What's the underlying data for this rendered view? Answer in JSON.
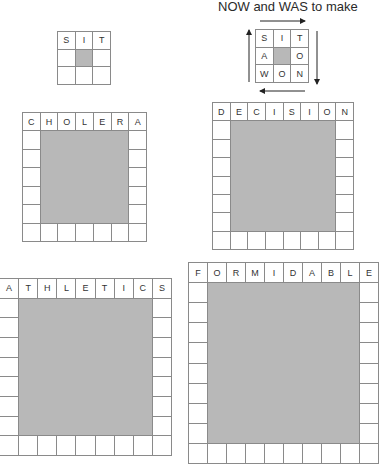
{
  "caption": "NOW and WAS to make",
  "colors": {
    "line": "#8a8a8a",
    "shade": "#b8b8b8",
    "text": "#333333"
  },
  "grids": [
    {
      "id": "sit-example",
      "word": "SIT",
      "size": 3,
      "box": {
        "left": 57,
        "top": 31,
        "width": 54,
        "height": 54
      },
      "top_row": [
        "S",
        "I",
        "T"
      ],
      "left_col": [
        "",
        "",
        ""
      ],
      "right_col": [
        "",
        "",
        ""
      ],
      "bottom_row": [
        "",
        "",
        ""
      ]
    },
    {
      "id": "sit-solved",
      "word": "SIT",
      "size": 3,
      "box": {
        "left": 255,
        "top": 29,
        "width": 54,
        "height": 54
      },
      "top_row": [
        "S",
        "I",
        "T"
      ],
      "left_col": [
        "S",
        "A",
        "W"
      ],
      "right_col": [
        "T",
        "O",
        "N"
      ],
      "bottom_row": [
        "W",
        "O",
        "N"
      ]
    },
    {
      "id": "cholera",
      "word": "CHOLERA",
      "size": 7,
      "box": {
        "left": 22,
        "top": 112,
        "width": 125,
        "height": 130
      },
      "top_row": [
        "C",
        "H",
        "O",
        "L",
        "E",
        "R",
        "A"
      ]
    },
    {
      "id": "decision",
      "word": "DECISION",
      "size": 8,
      "box": {
        "left": 212,
        "top": 102,
        "width": 142,
        "height": 148
      },
      "top_row": [
        "D",
        "E",
        "C",
        "I",
        "S",
        "I",
        "O",
        "N"
      ]
    },
    {
      "id": "athletics",
      "word": "ATHLETICS",
      "size": 9,
      "box": {
        "left": -1,
        "top": 278,
        "width": 173,
        "height": 178
      },
      "top_row": [
        "A",
        "T",
        "H",
        "L",
        "E",
        "T",
        "I",
        "C",
        "S"
      ]
    },
    {
      "id": "formidable",
      "word": "FORMIDABLE",
      "size": 10,
      "box": {
        "left": 188,
        "top": 262,
        "width": 191,
        "height": 202
      },
      "top_row": [
        "F",
        "O",
        "R",
        "M",
        "I",
        "D",
        "A",
        "B",
        "L",
        "E"
      ]
    }
  ],
  "arrows": [
    {
      "name": "arrow-right-icon",
      "dir": "right",
      "x1": 260,
      "y1": 21,
      "x2": 305,
      "y2": 21
    },
    {
      "name": "arrow-down-icon",
      "dir": "down",
      "x1": 317,
      "y1": 31,
      "x2": 317,
      "y2": 84
    },
    {
      "name": "arrow-left-icon",
      "dir": "left",
      "x1": 305,
      "y1": 91,
      "x2": 260,
      "y2": 91
    },
    {
      "name": "arrow-up-icon",
      "dir": "up",
      "x1": 249,
      "y1": 82,
      "x2": 249,
      "y2": 30
    }
  ]
}
